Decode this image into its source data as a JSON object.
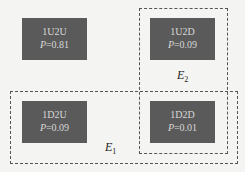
{
  "outcomes": [
    {
      "label": "1U2U",
      "p_prefix": "P",
      "p_value": "=0.81"
    },
    {
      "label": "1U2D",
      "p_prefix": "P",
      "p_value": "=0.09"
    },
    {
      "label": "1D2U",
      "p_prefix": "P",
      "p_value": "=0.09"
    },
    {
      "label": "1D2D",
      "p_prefix": "P",
      "p_value": "=0.01"
    }
  ],
  "events": [
    {
      "name": "E",
      "sub": "1"
    },
    {
      "name": "E",
      "sub": "2"
    }
  ]
}
